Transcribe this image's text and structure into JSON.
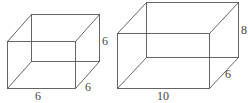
{
  "figure": {
    "boxes": [
      {
        "name": "cube",
        "dimensions": {
          "length": 6,
          "width": 6,
          "height": 6
        },
        "labels": {
          "height": "6",
          "depth": "6",
          "length": "6"
        }
      },
      {
        "name": "rectangular-prism",
        "dimensions": {
          "length": 10,
          "width": 6,
          "height": 8
        },
        "labels": {
          "height": "8",
          "depth": "6",
          "length": "10"
        }
      }
    ],
    "colors": {
      "line": "#555555",
      "text": "#444444",
      "background": "#ffffff"
    }
  }
}
